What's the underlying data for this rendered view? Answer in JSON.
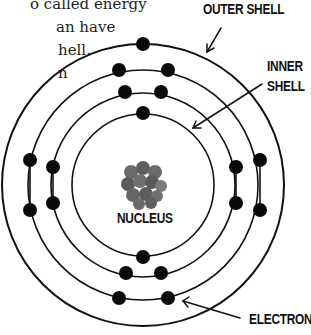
{
  "text_fragments": [
    {
      "text": "o called energy",
      "x": 30,
      "y": -5
    },
    {
      "text": "an have",
      "x": 56,
      "y": 18
    },
    {
      "text": "hell.",
      "x": 58,
      "y": 41
    },
    {
      "text": "n",
      "x": 58,
      "y": 64
    }
  ],
  "labels": {
    "outer_shell": "OUTER SHELL",
    "inner_shell_line1": "INNER",
    "inner_shell_line2": "SHELL",
    "nucleus": "NUCLEUS",
    "electron": "ELECTRON"
  },
  "diagram": {
    "center": [
      143,
      185
    ],
    "shells": [
      {
        "name": "shell-1",
        "radius": 71,
        "electrons": 2
      },
      {
        "name": "shell-2",
        "radius": 92,
        "electrons": 8
      },
      {
        "name": "shell-3",
        "radius": 115,
        "electrons": 8
      },
      {
        "name": "shell-4",
        "radius": 141,
        "electrons": 1
      }
    ],
    "colors": {
      "line": "#111111",
      "electron": "#0a0a0a",
      "nucleus": "#666666"
    }
  }
}
